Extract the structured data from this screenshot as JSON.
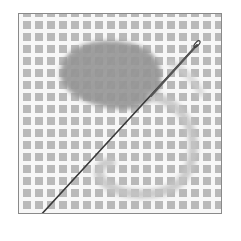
{
  "image": {
    "subject": "needlepoint canvas with yarn and needle",
    "description": "Grayscale photo of a needlepoint canvas grid partially covered by a tent-stitched yarn patch, with a loop of yarn and a threaded needle crossing diagonally.",
    "colors": {
      "canvas_thread": "#f7f7f7",
      "canvas_hole": "#b9b9b9",
      "yarn": "#8e8e8e",
      "yarn_loop": "#c4c4c4",
      "needle": "#3a3a3a",
      "border": "#8a8a8a"
    }
  }
}
